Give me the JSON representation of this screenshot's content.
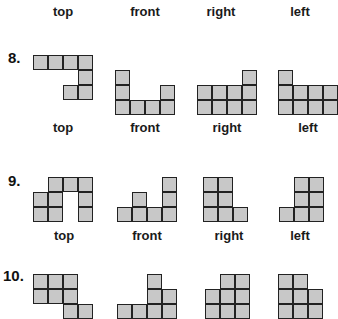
{
  "header": {
    "labels": [
      {
        "text": "top",
        "x": 63
      },
      {
        "text": "front",
        "x": 145
      },
      {
        "text": "right",
        "x": 221
      },
      {
        "text": "left",
        "x": 300
      }
    ],
    "y": 0
  },
  "style": {
    "cell_fill": "#c8c8c8",
    "cell_border": "#222222",
    "cell_size": 15
  },
  "problems": [
    {
      "number": "8.",
      "number_pos": {
        "x": 8,
        "y": 50
      },
      "labels_y": 121,
      "labels": [
        {
          "text": "top",
          "x": 63
        },
        {
          "text": "front",
          "x": 145
        },
        {
          "text": "right",
          "x": 227
        },
        {
          "text": "left",
          "x": 308
        }
      ],
      "views": [
        {
          "name": "top",
          "x": 33,
          "y": 55,
          "cells": [
            [
              0,
              0
            ],
            [
              1,
              0
            ],
            [
              2,
              0
            ],
            [
              3,
              0
            ],
            [
              3,
              1
            ],
            [
              2,
              2
            ],
            [
              3,
              2
            ]
          ]
        },
        {
          "name": "front",
          "x": 115,
          "y": 70,
          "cells": [
            [
              0,
              0
            ],
            [
              0,
              1
            ],
            [
              0,
              2
            ],
            [
              1,
              2
            ],
            [
              2,
              2
            ],
            [
              3,
              1
            ],
            [
              3,
              2
            ]
          ]
        },
        {
          "name": "right",
          "x": 197,
          "y": 70,
          "cells": [
            [
              3,
              0
            ],
            [
              0,
              1
            ],
            [
              1,
              1
            ],
            [
              2,
              1
            ],
            [
              3,
              1
            ],
            [
              0,
              2
            ],
            [
              1,
              2
            ],
            [
              2,
              2
            ],
            [
              3,
              2
            ]
          ]
        },
        {
          "name": "left",
          "x": 278,
          "y": 70,
          "cells": [
            [
              0,
              0
            ],
            [
              0,
              1
            ],
            [
              1,
              1
            ],
            [
              2,
              1
            ],
            [
              3,
              1
            ],
            [
              0,
              2
            ],
            [
              1,
              2
            ],
            [
              2,
              2
            ],
            [
              3,
              2
            ]
          ]
        }
      ]
    },
    {
      "number": "9.",
      "number_pos": {
        "x": 8,
        "y": 173
      },
      "labels_y": 229,
      "labels": [
        {
          "text": "top",
          "x": 64
        },
        {
          "text": "front",
          "x": 147
        },
        {
          "text": "right",
          "x": 229
        },
        {
          "text": "left",
          "x": 300
        }
      ],
      "views": [
        {
          "name": "top",
          "x": 33,
          "y": 177,
          "cells": [
            [
              1,
              0
            ],
            [
              2,
              0
            ],
            [
              3,
              0
            ],
            [
              0,
              1
            ],
            [
              1,
              1
            ],
            [
              3,
              1
            ],
            [
              0,
              2
            ],
            [
              1,
              2
            ],
            [
              3,
              2
            ]
          ]
        },
        {
          "name": "front",
          "x": 117,
          "y": 177,
          "cells": [
            [
              3,
              0
            ],
            [
              1,
              1
            ],
            [
              3,
              1
            ],
            [
              0,
              2
            ],
            [
              1,
              2
            ],
            [
              2,
              2
            ],
            [
              3,
              2
            ]
          ]
        },
        {
          "name": "right",
          "x": 203,
          "y": 177,
          "cells": [
            [
              0,
              0
            ],
            [
              1,
              0
            ],
            [
              0,
              1
            ],
            [
              1,
              1
            ],
            [
              0,
              2
            ],
            [
              1,
              2
            ],
            [
              2,
              2
            ]
          ]
        },
        {
          "name": "left",
          "x": 279,
          "y": 177,
          "cells": [
            [
              1,
              0
            ],
            [
              2,
              0
            ],
            [
              1,
              1
            ],
            [
              2,
              1
            ],
            [
              0,
              2
            ],
            [
              1,
              2
            ],
            [
              2,
              2
            ]
          ]
        }
      ]
    },
    {
      "number": "10.",
      "number_pos": {
        "x": 3,
        "y": 268
      },
      "labels_y": null,
      "labels": [],
      "views": [
        {
          "name": "top",
          "x": 33,
          "y": 274,
          "cells": [
            [
              0,
              0
            ],
            [
              1,
              0
            ],
            [
              2,
              0
            ],
            [
              0,
              1
            ],
            [
              1,
              1
            ],
            [
              2,
              1
            ],
            [
              2,
              2
            ],
            [
              3,
              2
            ]
          ]
        },
        {
          "name": "front",
          "x": 117,
          "y": 274,
          "cells": [
            [
              2,
              0
            ],
            [
              2,
              1
            ],
            [
              3,
              1
            ],
            [
              0,
              2
            ],
            [
              1,
              2
            ],
            [
              2,
              2
            ],
            [
              3,
              2
            ]
          ]
        },
        {
          "name": "right",
          "x": 205,
          "y": 274,
          "cells": [
            [
              1,
              0
            ],
            [
              2,
              0
            ],
            [
              0,
              1
            ],
            [
              1,
              1
            ],
            [
              2,
              1
            ],
            [
              0,
              2
            ],
            [
              1,
              2
            ],
            [
              2,
              2
            ]
          ]
        },
        {
          "name": "left",
          "x": 278,
          "y": 274,
          "cells": [
            [
              0,
              0
            ],
            [
              1,
              0
            ],
            [
              0,
              1
            ],
            [
              1,
              1
            ],
            [
              2,
              1
            ],
            [
              0,
              2
            ],
            [
              1,
              2
            ],
            [
              2,
              2
            ]
          ]
        }
      ]
    }
  ]
}
